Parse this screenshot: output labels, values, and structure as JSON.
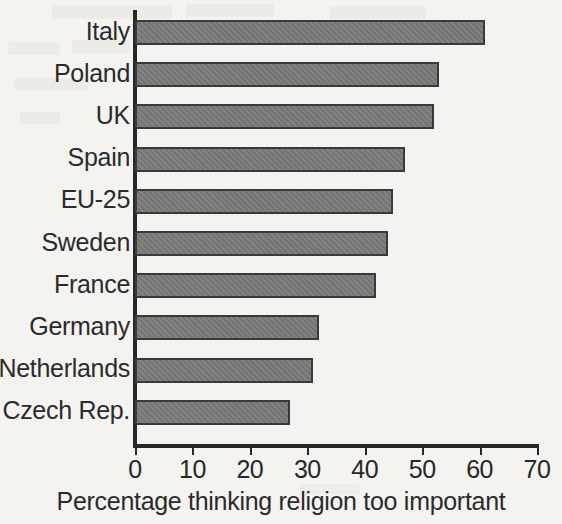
{
  "chart_data": {
    "type": "bar",
    "orientation": "horizontal",
    "title": "",
    "xlabel": "Percentage thinking religion too important",
    "ylabel": "",
    "categories": [
      "Italy",
      "Poland",
      "UK",
      "Spain",
      "EU-25",
      "Sweden",
      "France",
      "Germany",
      "Netherlands",
      "Czech Rep."
    ],
    "values": [
      61,
      53,
      52,
      47,
      45,
      44,
      42,
      32,
      31,
      27
    ],
    "xlim": [
      0,
      70
    ],
    "xticks": [
      0,
      10,
      20,
      30,
      40,
      50,
      60,
      70
    ],
    "xticklabels": [
      "0",
      "10",
      "20",
      "30",
      "40",
      "50",
      "60",
      "70"
    ],
    "grid": false,
    "legend": null,
    "series": [
      {
        "name": "Percentage thinking religion too important",
        "values": [
          61,
          53,
          52,
          47,
          45,
          44,
          42,
          32,
          31,
          27
        ]
      }
    ],
    "colors": {
      "bar_fill": "#7a7a7a",
      "bar_edge": "#3a3a3a",
      "axis": "#272727",
      "text": "#2b2b2b",
      "background": "#f4f3f0"
    }
  }
}
